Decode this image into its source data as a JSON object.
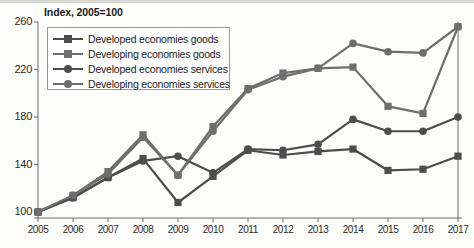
{
  "chart_data": {
    "type": "line",
    "title": "Index, 2005=100",
    "xlabel": "",
    "ylabel": "",
    "grid": false,
    "legend_position": "top-left",
    "ylim": [
      100,
      260
    ],
    "yticks": [
      100,
      140,
      180,
      220,
      260
    ],
    "x": [
      2005,
      2006,
      2007,
      2008,
      2009,
      2010,
      2011,
      2012,
      2013,
      2014,
      2015,
      2016,
      2017
    ],
    "categories": [
      "2005",
      "2006",
      "2007",
      "2008",
      "2009",
      "2010",
      "2011",
      "2012",
      "2013",
      "2014",
      "2015",
      "2016",
      "2017"
    ],
    "series": [
      {
        "name": "Developed economies goods",
        "marker": "square",
        "color": "#4d4d4d",
        "values": [
          100,
          112,
          129,
          145,
          108,
          130,
          152,
          148,
          151,
          153,
          135,
          136,
          147
        ]
      },
      {
        "name": "Developing economies goods",
        "marker": "square",
        "color": "#6e6e6e",
        "values": [
          100,
          114,
          134,
          165,
          131,
          172,
          204,
          217,
          221,
          222,
          189,
          183,
          256
        ]
      },
      {
        "name": "Developed economies services",
        "marker": "circle",
        "color": "#4d4d4d",
        "values": [
          100,
          112,
          129,
          143,
          147,
          133,
          153,
          152,
          157,
          178,
          168,
          168,
          180
        ]
      },
      {
        "name": "Developing economies services",
        "marker": "circle",
        "color": "#6e6e6e",
        "values": [
          100,
          114,
          132,
          163,
          131,
          168,
          203,
          214,
          221,
          242,
          235,
          234,
          256
        ]
      }
    ]
  },
  "legend": {
    "entries": [
      {
        "label": "Developed economies goods"
      },
      {
        "label": "Developing economies goods"
      },
      {
        "label": "Developed economies services"
      },
      {
        "label": "Developing economies services"
      }
    ]
  },
  "axes": {
    "y_tick_labels": [
      "260",
      "220",
      "180",
      "140",
      "100"
    ],
    "x_tick_labels": [
      "2005",
      "2006",
      "2007",
      "2008",
      "2009",
      "2010",
      "2011",
      "2012",
      "2013",
      "2014",
      "2015",
      "2016",
      "2017"
    ]
  },
  "colors": {
    "dark_series": "#4d4d4d",
    "light_series": "#6e6e6e",
    "axis": "#6b6b6b",
    "text": "#1b1b1b",
    "background": "#fdfdfb"
  }
}
